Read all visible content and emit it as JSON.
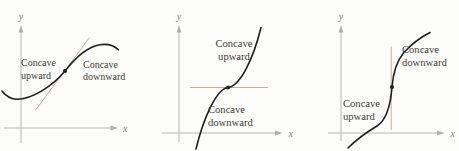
{
  "palette": {
    "paper": "#fcfcfa",
    "curve": "#1e1e1e",
    "axis": "#b0afad",
    "tangent": "#c0b2a3",
    "ink": "#3d3c3a",
    "axis-ink": "#85837f"
  },
  "panels": [
    {
      "name": "inflection-with-oblique-tangent",
      "axes": {
        "x_label": "x",
        "y_label": "y"
      },
      "annotations": [
        {
          "lines": [
            "Concave",
            "upward"
          ]
        },
        {
          "lines": [
            "Concave",
            "downward"
          ]
        }
      ]
    },
    {
      "name": "inflection-with-horizontal-tangent",
      "axes": {
        "x_label": "x",
        "y_label": "y"
      },
      "annotations": [
        {
          "lines": [
            "Concave",
            "upward"
          ]
        },
        {
          "lines": [
            "Concave",
            "downward"
          ]
        }
      ]
    },
    {
      "name": "inflection-with-vertical-tangent",
      "axes": {
        "x_label": "x",
        "y_label": "y"
      },
      "annotations": [
        {
          "lines": [
            "Concave",
            "downward"
          ]
        },
        {
          "lines": [
            "Concave",
            "upward"
          ]
        }
      ]
    }
  ]
}
